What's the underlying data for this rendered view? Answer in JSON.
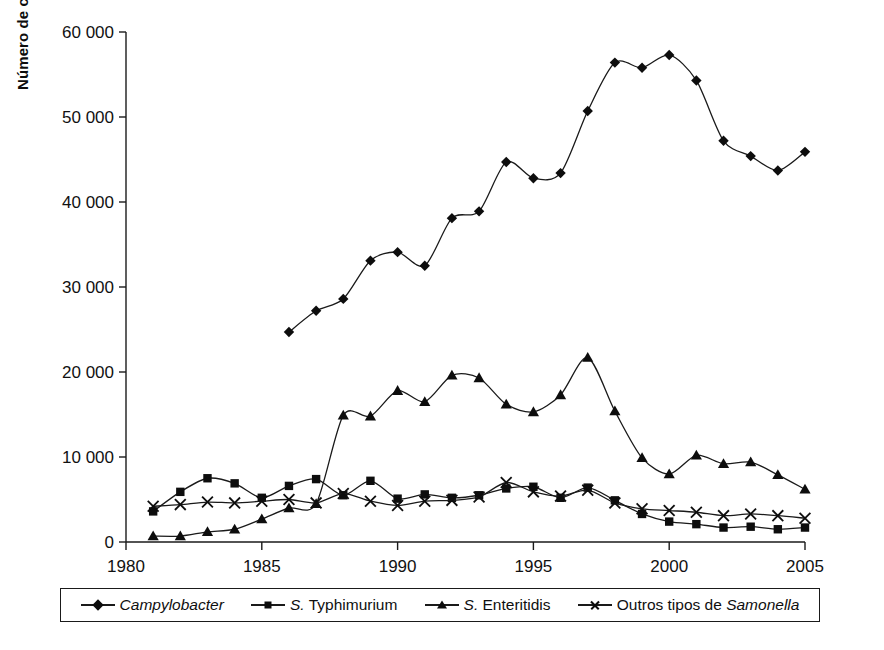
{
  "chart_data": {
    "type": "line",
    "title": "",
    "xlabel": "",
    "ylabel": "Número de casos notificados",
    "xlim": [
      1980,
      2005
    ],
    "ylim": [
      0,
      60000
    ],
    "grid": false,
    "legend_position": "bottom",
    "x_ticks": [
      "1980",
      "1985",
      "1990",
      "1995",
      "2000",
      "2005"
    ],
    "y_ticks": [
      "0",
      "10 000",
      "20 000",
      "30 000",
      "40 000",
      "50 000",
      "60 000"
    ],
    "x": [
      1981,
      1982,
      1983,
      1984,
      1985,
      1986,
      1987,
      1988,
      1989,
      1990,
      1991,
      1992,
      1993,
      1994,
      1995,
      1996,
      1997,
      1998,
      1999,
      2000,
      2001,
      2002,
      2003,
      2004,
      2005
    ],
    "series": [
      {
        "name": "Campylobacter",
        "marker": "diamond",
        "italic": true,
        "x": [
          1986,
          1987,
          1988,
          1989,
          1990,
          1991,
          1992,
          1993,
          1994,
          1995,
          1996,
          1997,
          1998,
          1999,
          2000,
          2001,
          2002,
          2003,
          2004,
          2005
        ],
        "values": [
          24700,
          27200,
          28600,
          33100,
          34100,
          32500,
          38100,
          38900,
          44700,
          42800,
          43400,
          50700,
          56400,
          55800,
          57300,
          54300,
          47200,
          45400,
          43700,
          45900
        ]
      },
      {
        "name": "S. Typhimurium",
        "marker": "square",
        "italic": false,
        "x": [
          1981,
          1982,
          1983,
          1984,
          1985,
          1986,
          1987,
          1988,
          1989,
          1990,
          1991,
          1992,
          1993,
          1994,
          1995,
          1996,
          1997,
          1998,
          1999,
          2000,
          2001,
          2002,
          2003,
          2004,
          2005
        ],
        "values": [
          3600,
          5900,
          7500,
          6900,
          5200,
          6600,
          7400,
          5500,
          7200,
          5100,
          5600,
          5200,
          5500,
          6300,
          6500,
          5200,
          6400,
          4900,
          3300,
          2400,
          2100,
          1700,
          1800,
          1500,
          1700
        ]
      },
      {
        "name": "S. Enteritidis",
        "marker": "triangle",
        "italic": false,
        "x": [
          1981,
          1982,
          1983,
          1984,
          1985,
          1986,
          1987,
          1988,
          1989,
          1990,
          1991,
          1992,
          1993,
          1994,
          1995,
          1996,
          1997,
          1998,
          1999,
          2000,
          2001,
          2002,
          2003,
          2004,
          2005
        ],
        "values": [
          700,
          700,
          1200,
          1500,
          2700,
          4000,
          4500,
          14900,
          14800,
          17800,
          16500,
          19600,
          19300,
          16200,
          15300,
          17300,
          21700,
          15400,
          9900,
          8000,
          10200,
          9200,
          9400,
          7900,
          6200
        ]
      },
      {
        "name": "Outros tipos de Samonella",
        "marker": "cross",
        "italic_word": "Samonella",
        "x": [
          1981,
          1982,
          1983,
          1984,
          1985,
          1986,
          1987,
          1988,
          1989,
          1990,
          1991,
          1992,
          1993,
          1994,
          1995,
          1996,
          1997,
          1998,
          1999,
          2000,
          2001,
          2002,
          2003,
          2004,
          2005
        ],
        "values": [
          4200,
          4400,
          4700,
          4600,
          4800,
          5000,
          4600,
          5700,
          4800,
          4300,
          4800,
          4900,
          5300,
          7000,
          5900,
          5400,
          6100,
          4600,
          3900,
          3700,
          3500,
          3100,
          3300,
          3100,
          2800
        ]
      }
    ]
  },
  "legend": {
    "items": [
      {
        "label": "Campylobacter",
        "marker": "diamond",
        "style": "italic"
      },
      {
        "label_prefix": "S.",
        "label_rest": "Typhimurium",
        "marker": "square",
        "style": "prefix-italic"
      },
      {
        "label_prefix": "S.",
        "label_rest": "Enteritidis",
        "marker": "triangle",
        "style": "prefix-italic"
      },
      {
        "label_prefix": "Outros tipos de",
        "label_rest": "Samonella",
        "marker": "cross",
        "style": "suffix-italic"
      }
    ]
  },
  "axis": {
    "y_title": "Número de casos notificados"
  }
}
